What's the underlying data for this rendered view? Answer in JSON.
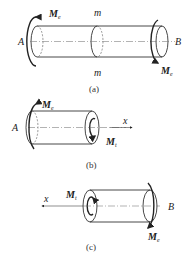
{
  "panels": [
    {
      "caption": "(a)",
      "labels": {
        "left_end": "A",
        "right_end": "B",
        "section_top": "m",
        "section_bottom": "m",
        "moment_left": "M",
        "moment_left_sub": "e",
        "moment_right": "M",
        "moment_right_sub": "e"
      }
    },
    {
      "caption": "(b)",
      "labels": {
        "left_end": "A",
        "axis": "x",
        "moment_applied": "M",
        "moment_applied_sub": "e",
        "internal_torque": "M",
        "internal_torque_sub": "t"
      }
    },
    {
      "caption": "(c)",
      "labels": {
        "right_end": "B",
        "axis": "x",
        "internal_torque": "M",
        "internal_torque_sub": "t",
        "moment_applied": "M",
        "moment_applied_sub": "e"
      }
    }
  ]
}
